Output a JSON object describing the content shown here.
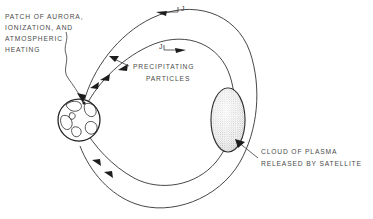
{
  "figure": {
    "background_color": "#ffffff",
    "ink_color": "#262626",
    "text_color": "#4a4a4a"
  },
  "labels": {
    "aurora": {
      "lines": [
        "PATCH OF AURORA,",
        "IONIZATION, AND",
        "ATMOSPHERIC",
        "HEATING"
      ],
      "line1": "PATCH OF AURORA,",
      "line2": "IONIZATION, AND",
      "line3": "ATMOSPHERIC",
      "line4": "HEATING"
    },
    "precipitating": {
      "line1": "PRECIPITATING",
      "line2": "PARTICLES"
    },
    "cloud": {
      "line1": "CLOUD OF PLASMA",
      "line2": "RELEASED BY SATELLITE"
    },
    "current_outer": "J",
    "current_inner": "J"
  },
  "objects": {
    "earth": {
      "name": "earth-globe",
      "center_x": 79,
      "center_y": 120,
      "radius": 21
    },
    "plasma_cloud": {
      "name": "plasma-cloud",
      "center_x": 228,
      "center_y": 120,
      "rx": 17,
      "ry": 32,
      "fill_style": "stipple"
    }
  },
  "field_lines": {
    "outer_loop_label": "outer-magnetic-field-line",
    "inner_loop_label": "inner-magnetic-field-line",
    "current_direction_outer": "leftward",
    "current_direction_inner": "rightward",
    "precipitation_direction": "toward-earth-pole"
  }
}
